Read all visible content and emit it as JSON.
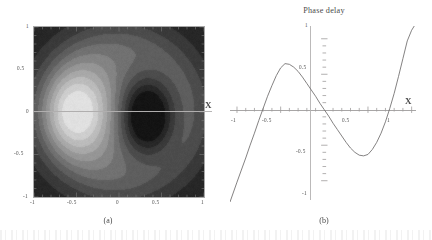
{
  "figure": {
    "panel_a": {
      "caption": "(a)",
      "axis_label_x": "X",
      "x_ticks": [
        "-1",
        "-0.5",
        "0",
        "0.5",
        "1"
      ],
      "y_ticks": [
        "1",
        "0.5",
        "0",
        "-0.5",
        "-1"
      ]
    },
    "panel_b": {
      "title": "Phase delay",
      "caption": "(b)",
      "axis_label_x": "X",
      "x_ticks": [
        "-1",
        "-0.5",
        "0.5",
        "1"
      ],
      "y_ticks": [
        "1",
        "0.5",
        "-0.5",
        "-1"
      ]
    }
  },
  "chart_data": [
    {
      "type": "heatmap",
      "title": "",
      "panel": "(a)",
      "xlabel": "X",
      "ylabel": "",
      "xlim": [
        -1,
        1
      ],
      "ylim": [
        -1,
        1
      ],
      "xticks": [
        -1,
        -0.5,
        0,
        0.5,
        1
      ],
      "yticks": [
        -1,
        -0.5,
        0,
        0.5,
        1
      ],
      "xticklabels": [
        "-1",
        "-0.5",
        "0",
        "0.5",
        "1"
      ],
      "yticklabels": [
        "-1",
        "-0.5",
        "0",
        "0.5",
        "1"
      ],
      "colormap": "grayscale",
      "grid": false,
      "legend": "none",
      "description": "Grayscale density plot with a bright lobe centred near (-0.52, 0.0) and a dark lobe centred near (0.33, -0.05); intensity falls to dark at all four corners.",
      "features": [
        {
          "name": "bright-lobe-center",
          "x": -0.52,
          "y": 0.0,
          "value": 1.0
        },
        {
          "name": "dark-lobe-center",
          "x": 0.33,
          "y": -0.05,
          "value": 0.0
        },
        {
          "name": "corner-intensity",
          "value": 0.12
        }
      ]
    },
    {
      "type": "line",
      "title": "Phase delay",
      "panel": "(b)",
      "xlabel": "X",
      "ylabel": "",
      "xlim": [
        -1.08,
        1.05
      ],
      "ylim": [
        -1.3,
        1.18
      ],
      "xticks": [
        -1,
        -0.5,
        0.5,
        1
      ],
      "yticks": [
        -1,
        -0.5,
        0.5,
        1
      ],
      "xticklabels": [
        "-1",
        "-0.5",
        "0.5",
        "1"
      ],
      "yticklabels": [
        "-1",
        "-0.5",
        "0.5",
        "1"
      ],
      "grid": false,
      "legend": "none",
      "series": [
        {
          "name": "phase delay",
          "x": [
            -1.08,
            -1.0,
            -0.95,
            -0.9,
            -0.85,
            -0.8,
            -0.75,
            -0.7,
            -0.65,
            -0.6,
            -0.55,
            -0.5,
            -0.45,
            -0.4,
            -0.35,
            -0.3,
            -0.25,
            -0.2,
            -0.15,
            -0.1,
            -0.05,
            0.0,
            0.05,
            0.1,
            0.15,
            0.2,
            0.25,
            0.3,
            0.35,
            0.4,
            0.45,
            0.5,
            0.55,
            0.6,
            0.65,
            0.7,
            0.75,
            0.8,
            0.85,
            0.9,
            0.95,
            1.0,
            1.03
          ],
          "y": [
            -1.3,
            -1.02,
            -0.85,
            -0.68,
            -0.5,
            -0.33,
            -0.15,
            0.02,
            0.19,
            0.34,
            0.48,
            0.59,
            0.65,
            0.64,
            0.6,
            0.54,
            0.46,
            0.37,
            0.28,
            0.19,
            0.09,
            0.0,
            -0.09,
            -0.19,
            -0.28,
            -0.37,
            -0.46,
            -0.54,
            -0.6,
            -0.64,
            -0.65,
            -0.63,
            -0.56,
            -0.46,
            -0.33,
            -0.17,
            0.02,
            0.23,
            0.47,
            0.72,
            0.97,
            1.12,
            1.18
          ]
        }
      ],
      "zero_crossings": [
        -0.72,
        0.0,
        0.74
      ],
      "local_max": {
        "x": -0.47,
        "y": 0.65
      },
      "local_min": {
        "x": 0.47,
        "y": -0.65
      }
    }
  ]
}
